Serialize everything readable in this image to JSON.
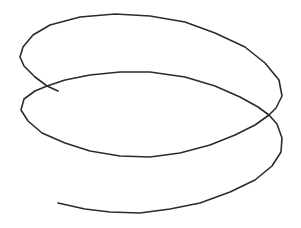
{
  "figure": {
    "stroke_color": "#2b2b2b",
    "background_color": "#ffffff",
    "stroke_width": 1.6,
    "path": "M58,91 L47,86 L35,77 L24,66 L20,57 L23,47 L33,35 L50,25 L80,17 L115,14 L150,16 L185,22 L215,33 L245,47 L265,63 L279,80 L282,96 L276,108 L269,115 L255,125 L235,135 L210,145 L180,153 L150,157 L120,156 L90,151 L65,143 L42,133 L28,121 L21,110 L24,99 L35,91 L47,86 L65,80 L90,75 L120,72 L150,72 L185,77 L215,86 L240,97 L258,107 L269,115 L277,124 L282,138 L281,152 L272,166 L255,180 L230,192 L200,203 L170,209 L140,213 L110,212 L85,209 L58,203"
  }
}
